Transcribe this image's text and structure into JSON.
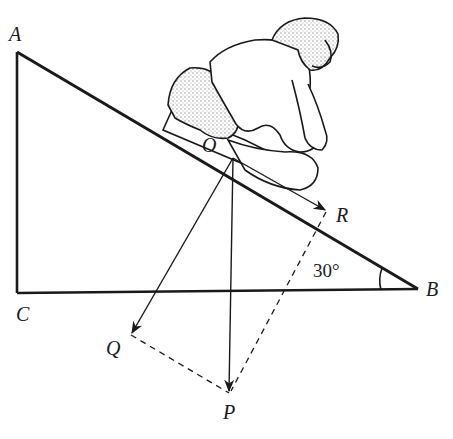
{
  "diagram": {
    "type": "inclined-plane force diagram",
    "points": {
      "A": {
        "label": "A",
        "x": 17,
        "y": 52
      },
      "B": {
        "label": "B",
        "x": 418,
        "y": 289
      },
      "C": {
        "label": "C",
        "x": 17,
        "y": 293
      },
      "O": {
        "label": "O",
        "x": 233,
        "y": 158
      },
      "R": {
        "label": "R",
        "x": 326,
        "y": 210
      },
      "Q": {
        "label": "Q",
        "x": 131,
        "y": 335
      },
      "P": {
        "label": "P",
        "x": 229,
        "y": 393
      }
    },
    "angle_label": "30°",
    "vectors": [
      {
        "name": "OP",
        "from": "O",
        "to": "P",
        "style": "solid-arrow"
      },
      {
        "name": "OQ",
        "from": "O",
        "to": "Q",
        "style": "solid-arrow"
      },
      {
        "name": "OR",
        "from": "O",
        "to": "R",
        "style": "solid-arrow"
      }
    ],
    "dashed_lines": [
      {
        "from": "Q",
        "to": "P"
      },
      {
        "from": "R",
        "to": "P"
      }
    ],
    "figure": "person crouching on a sled/block on the incline",
    "colors": {
      "ink": "#1a1a1a",
      "background": "#ffffff",
      "shading": "#9a9a9a"
    }
  }
}
